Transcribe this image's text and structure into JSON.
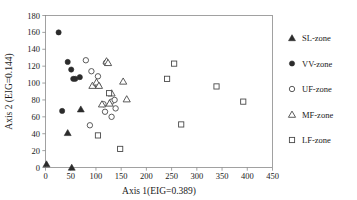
{
  "chart_data": {
    "type": "scatter",
    "title": "",
    "xlabel": "Axis 1(EIG=0.389)",
    "ylabel": "Axis 2 (EIG=0.144)",
    "xlim": [
      0,
      450
    ],
    "ylim": [
      0,
      180
    ],
    "xticks": [
      0,
      50,
      100,
      150,
      200,
      250,
      300,
      350,
      400,
      450
    ],
    "yticks": [
      0,
      20,
      40,
      60,
      80,
      100,
      120,
      140,
      160,
      180
    ],
    "grid": false,
    "legend_position": "right",
    "series": [
      {
        "name": "SL-zone",
        "marker": "filled-triangle",
        "color": "#2b2b2b",
        "points": [
          [
            2,
            4
          ],
          [
            52,
            0
          ],
          [
            44,
            41
          ],
          [
            70,
            69
          ]
        ]
      },
      {
        "name": "VV-zone",
        "marker": "filled-circle",
        "color": "#2b2b2b",
        "points": [
          [
            26,
            160
          ],
          [
            44,
            125
          ],
          [
            51,
            116
          ],
          [
            55,
            105
          ],
          [
            59,
            105
          ],
          [
            68,
            107
          ],
          [
            33,
            67
          ]
        ]
      },
      {
        "name": "UF-zone",
        "marker": "open-circle",
        "color": "#4a4a4a",
        "points": [
          [
            80,
            127
          ],
          [
            91,
            114
          ],
          [
            104,
            108
          ],
          [
            104,
            97
          ],
          [
            120,
            124
          ],
          [
            115,
            75
          ],
          [
            118,
            66
          ],
          [
            131,
            78
          ],
          [
            137,
            80
          ],
          [
            139,
            70
          ],
          [
            131,
            60
          ],
          [
            88,
            50
          ]
        ]
      },
      {
        "name": "MF-zone",
        "marker": "open-triangle",
        "color": "#4a4a4a",
        "points": [
          [
            93,
            97
          ],
          [
            101,
            101
          ],
          [
            106,
            97
          ],
          [
            121,
            126
          ],
          [
            124,
            124
          ],
          [
            112,
            75
          ],
          [
            127,
            76
          ],
          [
            131,
            88
          ],
          [
            154,
            102
          ],
          [
            161,
            81
          ]
        ]
      },
      {
        "name": "LF-zone",
        "marker": "open-square",
        "color": "#4a4a4a",
        "points": [
          [
            126,
            88
          ],
          [
            104,
            38
          ],
          [
            148,
            22
          ],
          [
            241,
            105
          ],
          [
            255,
            123
          ],
          [
            269,
            51
          ],
          [
            339,
            96
          ],
          [
            392,
            78
          ]
        ]
      }
    ]
  },
  "legend": {
    "items": [
      {
        "label": "SL-zone",
        "marker": "filled-triangle"
      },
      {
        "label": "VV-zone",
        "marker": "filled-circle"
      },
      {
        "label": "UF-zone",
        "marker": "open-circle"
      },
      {
        "label": "MF-zone",
        "marker": "open-triangle"
      },
      {
        "label": "LF-zone",
        "marker": "open-square"
      }
    ]
  }
}
